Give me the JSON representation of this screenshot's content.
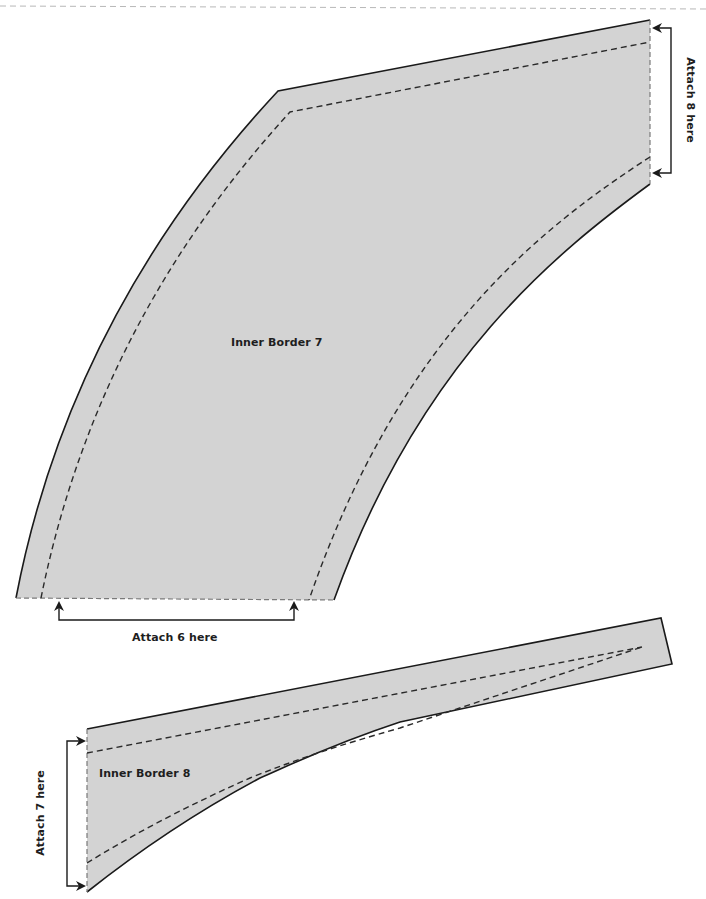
{
  "pieces": [
    {
      "id": "inner-border-7",
      "label": "Inner Border 7",
      "fill": "#d3d3d3"
    },
    {
      "id": "inner-border-8",
      "label": "Inner Border 8",
      "fill": "#d3d3d3"
    }
  ],
  "annotations": {
    "attach_6": "Attach 6 here",
    "attach_7": "Attach 7 here",
    "attach_8": "Attach 8 here"
  },
  "colors": {
    "piece_fill": "#d3d3d3",
    "cut_line": "#1a1a1a",
    "seam_line": "#2a2a2a",
    "page_edge": "#b8b8b8"
  }
}
